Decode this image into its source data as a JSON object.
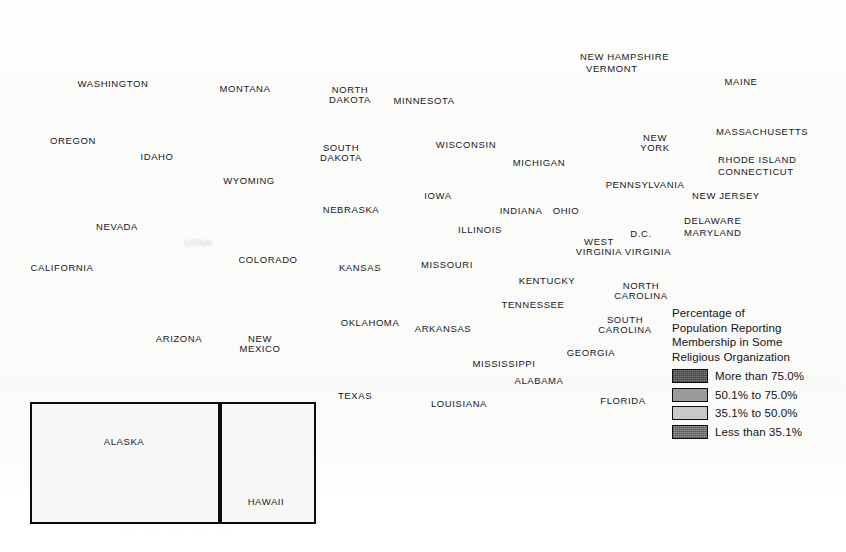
{
  "map": {
    "title": "Percentage of Population Reporting Membership in Some Religious Organization",
    "type": "choropleth",
    "geography": "United States counties",
    "background_color": "#fbfbfa",
    "water_color": "#ffffff",
    "border_color": "#0b0c0f"
  },
  "legend": {
    "title": "Percentage of\nPopulation Reporting\nMembership in Some\nReligious Organization",
    "items": [
      {
        "label": "More than 75.0%",
        "color": "#5e5e5e",
        "range_min": 75.0,
        "range_max": 100.0
      },
      {
        "label": "50.1% to 75.0%",
        "color": "#9a9a9a",
        "range_min": 50.1,
        "range_max": 75.0
      },
      {
        "label": "35.1% to 50.0%",
        "color": "#c9c9c7",
        "range_min": 35.1,
        "range_max": 50.0
      },
      {
        "label": "Less than 35.1%",
        "color": "#7e7e7e",
        "range_min": 0.0,
        "range_max": 35.1
      }
    ]
  },
  "insets": [
    {
      "name": "alaska",
      "label": "ALASKA"
    },
    {
      "name": "hawaii",
      "label": "HAWAII"
    }
  ],
  "bleed_through_text": "·   ·    ·  ·   ·    ·   ·   ·    ·   ·",
  "state_labels": [
    {
      "text": "WASHINGTON",
      "x": 113,
      "y": 84,
      "style": "dark"
    },
    {
      "text": "OREGON",
      "x": 73,
      "y": 141,
      "style": "dark"
    },
    {
      "text": "IDAHO",
      "x": 157,
      "y": 157,
      "style": "dark"
    },
    {
      "text": "MONTANA",
      "x": 245,
      "y": 89,
      "style": "dark"
    },
    {
      "text": "NORTH\nDAKOTA",
      "x": 350,
      "y": 95,
      "style": "dark"
    },
    {
      "text": "MINNESOTA",
      "x": 424,
      "y": 101,
      "style": "dark"
    },
    {
      "text": "SOUTH\nDAKOTA",
      "x": 341,
      "y": 153,
      "style": "dark"
    },
    {
      "text": "WISCONSIN",
      "x": 466,
      "y": 145,
      "style": "dark"
    },
    {
      "text": "MICHIGAN",
      "x": 539,
      "y": 163,
      "style": "dark"
    },
    {
      "text": "WYOMING",
      "x": 249,
      "y": 181,
      "style": "dark"
    },
    {
      "text": "NEBRASKA",
      "x": 351,
      "y": 210,
      "style": "dark"
    },
    {
      "text": "IOWA",
      "x": 438,
      "y": 196,
      "style": "dark"
    },
    {
      "text": "NEVADA",
      "x": 117,
      "y": 227,
      "style": "dark"
    },
    {
      "text": "UTAH",
      "x": 198,
      "y": 243,
      "style": "light"
    },
    {
      "text": "COLORADO",
      "x": 268,
      "y": 260,
      "style": "dark"
    },
    {
      "text": "KANSAS",
      "x": 360,
      "y": 268,
      "style": "dark"
    },
    {
      "text": "MISSOURI",
      "x": 447,
      "y": 265,
      "style": "dark"
    },
    {
      "text": "ILLINOIS",
      "x": 480,
      "y": 230,
      "style": "dark"
    },
    {
      "text": "INDIANA",
      "x": 521,
      "y": 211,
      "style": "dark"
    },
    {
      "text": "OHIO",
      "x": 566,
      "y": 211,
      "style": "dark"
    },
    {
      "text": "CALIFORNIA",
      "x": 62,
      "y": 268,
      "style": "dark"
    },
    {
      "text": "ARIZONA",
      "x": 179,
      "y": 339,
      "style": "dark"
    },
    {
      "text": "NEW\nMEXICO",
      "x": 260,
      "y": 344,
      "style": "dark"
    },
    {
      "text": "OKLAHOMA",
      "x": 370,
      "y": 323,
      "style": "dark"
    },
    {
      "text": "ARKANSAS",
      "x": 443,
      "y": 329,
      "style": "dark"
    },
    {
      "text": "TENNESSEE",
      "x": 533,
      "y": 305,
      "style": "dark"
    },
    {
      "text": "KENTUCKY",
      "x": 547,
      "y": 281,
      "style": "dark"
    },
    {
      "text": "WEST\nVIRGINIA",
      "x": 599,
      "y": 247,
      "style": "dark"
    },
    {
      "text": "VIRGINIA",
      "x": 648,
      "y": 252,
      "style": "dark"
    },
    {
      "text": "D.C.",
      "x": 641,
      "y": 234,
      "style": "dark"
    },
    {
      "text": "NORTH\nCAROLINA",
      "x": 641,
      "y": 291,
      "style": "dark"
    },
    {
      "text": "SOUTH\nCAROLINA",
      "x": 625,
      "y": 325,
      "style": "dark"
    },
    {
      "text": "GEORGIA",
      "x": 591,
      "y": 353,
      "style": "dark"
    },
    {
      "text": "MISSISSIPPI",
      "x": 504,
      "y": 364,
      "style": "dark"
    },
    {
      "text": "ALABAMA",
      "x": 539,
      "y": 381,
      "style": "dark"
    },
    {
      "text": "LOUISIANA",
      "x": 459,
      "y": 404,
      "style": "dark"
    },
    {
      "text": "TEXAS",
      "x": 355,
      "y": 396,
      "style": "dark"
    },
    {
      "text": "FLORIDA",
      "x": 623,
      "y": 401,
      "style": "dark"
    },
    {
      "text": "PENNSYLVANIA",
      "x": 645,
      "y": 185,
      "style": "dark"
    },
    {
      "text": "NEW\nYORK",
      "x": 655,
      "y": 143,
      "style": "dark"
    },
    {
      "text": "MAINE",
      "x": 741,
      "y": 82,
      "style": "dark"
    }
  ],
  "leader_labels": [
    {
      "text": "NEW HAMPSHIRE",
      "x": 580,
      "y": 57,
      "anchor": "left",
      "line": [
        [
          672,
          60
        ],
        [
          700,
          93
        ]
      ]
    },
    {
      "text": "VERMONT",
      "x": 586,
      "y": 69,
      "anchor": "left",
      "line": [
        [
          636,
          72
        ],
        [
          684,
          103
        ]
      ]
    },
    {
      "text": "MASSACHUSETTS",
      "x": 716,
      "y": 132,
      "anchor": "left",
      "line": [
        [
          712,
          134
        ],
        [
          700,
          138
        ]
      ]
    },
    {
      "text": "RHODE ISLAND",
      "x": 718,
      "y": 160,
      "anchor": "left",
      "line": [
        [
          714,
          161
        ],
        [
          698,
          152
        ]
      ]
    },
    {
      "text": "CONNECTICUT",
      "x": 718,
      "y": 172,
      "anchor": "left",
      "line": [
        [
          714,
          171
        ],
        [
          693,
          160
        ]
      ]
    },
    {
      "text": "NEW JERSEY",
      "x": 692,
      "y": 196,
      "anchor": "left",
      "line": [
        [
          688,
          197
        ],
        [
          676,
          192
        ]
      ]
    },
    {
      "text": "DELAWARE",
      "x": 684,
      "y": 221,
      "anchor": "left",
      "line": [
        [
          680,
          222
        ],
        [
          668,
          218
        ]
      ]
    },
    {
      "text": "MARYLAND",
      "x": 684,
      "y": 233,
      "anchor": "left",
      "line": [
        [
          680,
          234
        ],
        [
          662,
          228
        ]
      ]
    }
  ]
}
